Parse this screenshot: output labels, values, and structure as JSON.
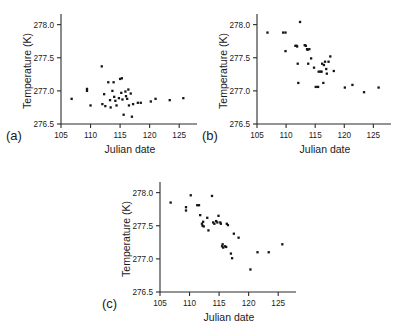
{
  "figure": {
    "background": "#ffffff",
    "point_color": "#151515",
    "axis_color": "#2b2b2b",
    "width": 395,
    "height": 330
  },
  "panels": [
    {
      "id": "a",
      "label": "(a)",
      "xlabel": "Julian date",
      "ylabel": "Temperature (K)",
      "xticks": [
        105,
        110,
        115,
        120,
        125
      ],
      "yticks": [
        "278.0",
        "277.5",
        "277.0",
        "276.5"
      ],
      "ytick_values": [
        278.0,
        277.5,
        277.0,
        276.5
      ]
    },
    {
      "id": "b",
      "label": "(b)",
      "xlabel": "Julian date",
      "ylabel": "Temperature (K)",
      "xticks": [
        105,
        110,
        115,
        120,
        125
      ],
      "yticks": [
        "278.0",
        "277.5",
        "277.0",
        "276.5"
      ],
      "ytick_values": [
        278.0,
        277.5,
        277.0,
        276.5
      ]
    },
    {
      "id": "c",
      "label": "(c)",
      "xlabel": "Julian date",
      "ylabel": "Temperature (K)",
      "xticks": [
        105,
        110,
        115,
        120,
        125
      ],
      "yticks": [
        "278.0",
        "277.5",
        "277.0",
        "276.5"
      ],
      "ytick_values": [
        278.0,
        277.5,
        277.0,
        276.5
      ]
    }
  ],
  "chart_data": [
    {
      "type": "scatter",
      "panel": "a",
      "title": "",
      "xlabel": "Julian date",
      "ylabel": "Temperature (K)",
      "xlim": [
        105,
        127
      ],
      "ylim": [
        276.5,
        278.1
      ],
      "xticks": [
        105,
        110,
        115,
        120,
        125
      ],
      "yticks": [
        276.5,
        277.0,
        277.5,
        278.0
      ],
      "grid": false,
      "legend": "none",
      "marker": "square",
      "points": [
        {
          "x": 106.8,
          "y": 276.88
        },
        {
          "x": 109.4,
          "y": 277.03
        },
        {
          "x": 109.4,
          "y": 277.0
        },
        {
          "x": 110.0,
          "y": 276.78
        },
        {
          "x": 111.9,
          "y": 277.37
        },
        {
          "x": 112.0,
          "y": 276.8
        },
        {
          "x": 112.3,
          "y": 276.95
        },
        {
          "x": 112.5,
          "y": 276.77
        },
        {
          "x": 113.0,
          "y": 277.13
        },
        {
          "x": 113.3,
          "y": 276.86
        },
        {
          "x": 113.4,
          "y": 276.75
        },
        {
          "x": 113.7,
          "y": 277.0
        },
        {
          "x": 113.9,
          "y": 277.13
        },
        {
          "x": 114.0,
          "y": 276.91
        },
        {
          "x": 114.2,
          "y": 276.85
        },
        {
          "x": 114.4,
          "y": 276.78
        },
        {
          "x": 114.8,
          "y": 276.89
        },
        {
          "x": 115.0,
          "y": 277.18
        },
        {
          "x": 115.2,
          "y": 276.97
        },
        {
          "x": 115.3,
          "y": 277.19
        },
        {
          "x": 115.4,
          "y": 276.87
        },
        {
          "x": 115.6,
          "y": 276.64
        },
        {
          "x": 115.9,
          "y": 276.99
        },
        {
          "x": 116.0,
          "y": 276.92
        },
        {
          "x": 116.2,
          "y": 276.88
        },
        {
          "x": 116.4,
          "y": 277.02
        },
        {
          "x": 116.5,
          "y": 276.78
        },
        {
          "x": 116.8,
          "y": 276.96
        },
        {
          "x": 117.0,
          "y": 276.61
        },
        {
          "x": 117.2,
          "y": 276.8
        },
        {
          "x": 118.0,
          "y": 276.82
        },
        {
          "x": 118.5,
          "y": 276.82
        },
        {
          "x": 120.2,
          "y": 276.84
        },
        {
          "x": 121.0,
          "y": 276.88
        },
        {
          "x": 123.4,
          "y": 276.86
        },
        {
          "x": 125.7,
          "y": 276.89
        }
      ]
    },
    {
      "type": "scatter",
      "panel": "b",
      "title": "",
      "xlabel": "Julian date",
      "ylabel": "Temperature (K)",
      "xlim": [
        105,
        127
      ],
      "ylim": [
        276.5,
        278.1
      ],
      "xticks": [
        105,
        110,
        115,
        120,
        125
      ],
      "yticks": [
        276.5,
        277.0,
        277.5,
        278.0
      ],
      "grid": false,
      "legend": "none",
      "marker": "square",
      "points": [
        {
          "x": 106.8,
          "y": 277.88
        },
        {
          "x": 109.5,
          "y": 277.88
        },
        {
          "x": 109.9,
          "y": 277.88
        },
        {
          "x": 109.9,
          "y": 277.6
        },
        {
          "x": 111.6,
          "y": 277.68
        },
        {
          "x": 111.8,
          "y": 277.68
        },
        {
          "x": 111.9,
          "y": 277.67
        },
        {
          "x": 112.0,
          "y": 277.41
        },
        {
          "x": 112.1,
          "y": 277.12
        },
        {
          "x": 112.4,
          "y": 278.04
        },
        {
          "x": 113.2,
          "y": 277.69
        },
        {
          "x": 113.4,
          "y": 277.68
        },
        {
          "x": 113.6,
          "y": 277.63
        },
        {
          "x": 113.7,
          "y": 277.62
        },
        {
          "x": 113.8,
          "y": 277.41
        },
        {
          "x": 114.0,
          "y": 277.63
        },
        {
          "x": 114.3,
          "y": 277.49
        },
        {
          "x": 114.8,
          "y": 277.35
        },
        {
          "x": 115.1,
          "y": 277.06
        },
        {
          "x": 115.5,
          "y": 277.06
        },
        {
          "x": 115.6,
          "y": 277.29
        },
        {
          "x": 115.9,
          "y": 277.29
        },
        {
          "x": 116.1,
          "y": 277.29
        },
        {
          "x": 116.2,
          "y": 277.41
        },
        {
          "x": 116.4,
          "y": 277.12
        },
        {
          "x": 116.5,
          "y": 277.39
        },
        {
          "x": 116.7,
          "y": 277.44
        },
        {
          "x": 116.9,
          "y": 277.33
        },
        {
          "x": 117.0,
          "y": 277.26
        },
        {
          "x": 117.3,
          "y": 277.44
        },
        {
          "x": 117.6,
          "y": 277.52
        },
        {
          "x": 118.2,
          "y": 277.3
        },
        {
          "x": 120.1,
          "y": 277.05
        },
        {
          "x": 121.4,
          "y": 277.09
        },
        {
          "x": 123.4,
          "y": 276.98
        },
        {
          "x": 125.9,
          "y": 277.05
        }
      ]
    },
    {
      "type": "scatter",
      "panel": "c",
      "title": "",
      "xlabel": "Julian date",
      "ylabel": "Temperature (K)",
      "xlim": [
        105,
        127
      ],
      "ylim": [
        276.5,
        278.1
      ],
      "xticks": [
        105,
        110,
        115,
        120,
        125
      ],
      "yticks": [
        276.5,
        277.0,
        277.5,
        278.0
      ],
      "grid": false,
      "legend": "none",
      "marker": "square",
      "points": [
        {
          "x": 106.8,
          "y": 277.85
        },
        {
          "x": 109.4,
          "y": 277.78
        },
        {
          "x": 109.4,
          "y": 277.73
        },
        {
          "x": 110.2,
          "y": 277.96
        },
        {
          "x": 111.3,
          "y": 277.81
        },
        {
          "x": 111.6,
          "y": 277.81
        },
        {
          "x": 111.8,
          "y": 277.66
        },
        {
          "x": 112.1,
          "y": 277.53
        },
        {
          "x": 112.2,
          "y": 277.5
        },
        {
          "x": 112.3,
          "y": 277.56
        },
        {
          "x": 112.4,
          "y": 277.49
        },
        {
          "x": 113.0,
          "y": 277.62
        },
        {
          "x": 113.2,
          "y": 277.43
        },
        {
          "x": 113.8,
          "y": 277.95
        },
        {
          "x": 114.0,
          "y": 277.55
        },
        {
          "x": 114.2,
          "y": 277.53
        },
        {
          "x": 114.5,
          "y": 277.57
        },
        {
          "x": 114.7,
          "y": 277.55
        },
        {
          "x": 114.9,
          "y": 277.65
        },
        {
          "x": 115.2,
          "y": 277.55
        },
        {
          "x": 115.3,
          "y": 277.53
        },
        {
          "x": 115.5,
          "y": 277.19
        },
        {
          "x": 115.6,
          "y": 277.22
        },
        {
          "x": 115.7,
          "y": 277.17
        },
        {
          "x": 116.0,
          "y": 277.19
        },
        {
          "x": 116.2,
          "y": 277.18
        },
        {
          "x": 116.3,
          "y": 277.53
        },
        {
          "x": 116.5,
          "y": 277.51
        },
        {
          "x": 117.0,
          "y": 277.08
        },
        {
          "x": 117.2,
          "y": 277.01
        },
        {
          "x": 117.5,
          "y": 277.38
        },
        {
          "x": 118.3,
          "y": 277.32
        },
        {
          "x": 120.3,
          "y": 276.84
        },
        {
          "x": 121.5,
          "y": 277.1
        },
        {
          "x": 123.4,
          "y": 277.1
        },
        {
          "x": 125.7,
          "y": 277.22
        }
      ]
    }
  ]
}
